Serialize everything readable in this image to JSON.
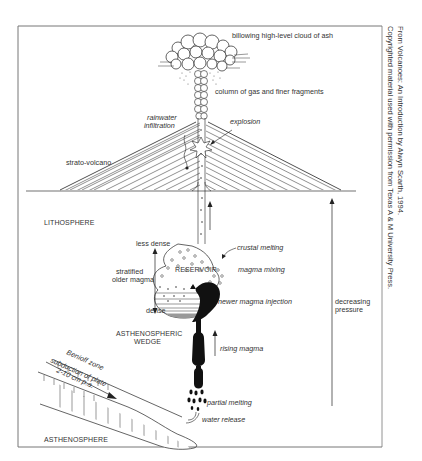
{
  "figure": {
    "labels": {
      "ash_cloud": "billowing high-level cloud of ash",
      "column": "column of gas and finer fragments",
      "rainwater": [
        "rainwater",
        "infiltration"
      ],
      "explosion": "explosion",
      "strato_volcano": "strato-volcano",
      "lithosphere": "LITHOSPHERE",
      "less_dense": "less dense",
      "stratified": [
        "stratified",
        "older magma"
      ],
      "dense": "dense",
      "reservoir": "RESERVOIR",
      "crustal_melting": "crustal melting",
      "magma_mixing": "magma mixing",
      "newer_injection": "newer magma injection",
      "decreasing_pressure": [
        "decreasing",
        "pressure"
      ],
      "asthenospheric_wedge": [
        "ASTHENOSPHERIC",
        "WEDGE"
      ],
      "rising_magma": "rising magma",
      "benioff": "Benioff zone",
      "subduction": "subduction of plate",
      "rate": "2-10 cm p.a.",
      "partial_melting": "partial melting",
      "water_release": "water release",
      "asthenosphere": "ASTHENOSPHERE"
    },
    "colors": {
      "ink": "#222222",
      "frame": "#6b6b6b",
      "text": "#333333",
      "background": "#ffffff"
    }
  },
  "credit": {
    "line1": "From Volcanoes: An Introduction by Alwyn Scarth, 1994.",
    "line2": "Copyrighted material used with permission from Texas A & M University Press."
  }
}
